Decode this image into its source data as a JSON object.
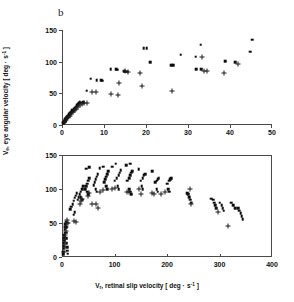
{
  "figure": {
    "panel_letter": "b",
    "background": "#ffffff",
    "marker_colors": {
      "square": "#0d0d0d",
      "plus": "#1a1a1a"
    },
    "axis_color": "#4a4a4a"
  },
  "axis_titles": {
    "y": "Ve, eye angular velocity [ deg · s-1 ]",
    "y_parts": {
      "symbol": "V",
      "symbol_sub": "e",
      "rest": ", eye angular velocity [ deg · s",
      "exp": "-1",
      "tail": " ]"
    },
    "x": "Vr, retinal slip velocity [ deg · s-1 ]",
    "x_parts": {
      "symbol": "V",
      "symbol_sub": "r",
      "rest": ", retinal slip velocity [ deg · s",
      "exp": "-1",
      "tail": " ]"
    }
  },
  "chart_data": [
    {
      "id": "top-panel",
      "type": "scatter",
      "title": "",
      "xlabel": "Vr, retinal slip velocity [ deg · s-1 ]",
      "ylabel": "Ve, eye angular velocity [ deg · s-1 ]",
      "xlim": [
        0,
        50
      ],
      "ylim": [
        0,
        150
      ],
      "xticks": [
        0,
        10,
        20,
        30,
        40,
        50
      ],
      "yticks": [
        0,
        50,
        100,
        150
      ],
      "xtick_labels": [
        "0",
        "10",
        "20",
        "30",
        "40",
        "50"
      ],
      "ytick_labels": [
        "0",
        "50",
        "100",
        "150"
      ],
      "grid": false,
      "legend": "none",
      "series": [
        {
          "name": "filled-square",
          "marker": "square",
          "points": [
            [
              0.3,
              3
            ],
            [
              0.4,
              5
            ],
            [
              0.5,
              4
            ],
            [
              0.6,
              7
            ],
            [
              0.7,
              6
            ],
            [
              0.8,
              9
            ],
            [
              0.9,
              8
            ],
            [
              1.0,
              11
            ],
            [
              1.1,
              10
            ],
            [
              1.2,
              13
            ],
            [
              1.3,
              12
            ],
            [
              1.4,
              15
            ],
            [
              1.5,
              14
            ],
            [
              1.6,
              17
            ],
            [
              1.8,
              16
            ],
            [
              1.9,
              19
            ],
            [
              2.0,
              18
            ],
            [
              2.1,
              21
            ],
            [
              2.3,
              20
            ],
            [
              2.4,
              23
            ],
            [
              2.6,
              22
            ],
            [
              2.8,
              25
            ],
            [
              3.0,
              27
            ],
            [
              3.2,
              26
            ],
            [
              3.4,
              29
            ],
            [
              3.6,
              31
            ],
            [
              3.8,
              33
            ],
            [
              4.0,
              35
            ],
            [
              4.2,
              36
            ],
            [
              4.5,
              35
            ],
            [
              5.0,
              36
            ],
            [
              5.9,
              54
            ],
            [
              6.8,
              73
            ],
            [
              8.3,
              71
            ],
            [
              9.3,
              71
            ],
            [
              9.6,
              70
            ],
            [
              11.6,
              88
            ],
            [
              12.9,
              88
            ],
            [
              13.2,
              87
            ],
            [
              14.8,
              85
            ],
            [
              15.2,
              84
            ],
            [
              15.5,
              84
            ],
            [
              19.5,
              121
            ],
            [
              20.2,
              121
            ],
            [
              21.0,
              99
            ],
            [
              26.0,
              94
            ],
            [
              26.5,
              94
            ],
            [
              28.3,
              111
            ],
            [
              31.8,
              108
            ],
            [
              32.0,
              88
            ],
            [
              33.0,
              127
            ],
            [
              33.2,
              88
            ],
            [
              38.8,
              101
            ],
            [
              41.3,
              99
            ],
            [
              44.8,
              116
            ],
            [
              45.3,
              135
            ]
          ]
        },
        {
          "name": "plus",
          "marker": "plus",
          "points": [
            [
              0.4,
              4
            ],
            [
              0.6,
              6
            ],
            [
              0.9,
              8
            ],
            [
              1.2,
              11
            ],
            [
              1.5,
              13
            ],
            [
              1.8,
              15
            ],
            [
              2.2,
              18
            ],
            [
              2.6,
              21
            ],
            [
              3.0,
              23
            ],
            [
              3.4,
              26
            ],
            [
              3.8,
              29
            ],
            [
              4.3,
              31
            ],
            [
              4.8,
              33
            ],
            [
              5.2,
              34
            ],
            [
              6.0,
              35
            ],
            [
              7.1,
              52
            ],
            [
              8.0,
              52
            ],
            [
              11.7,
              49
            ],
            [
              13.3,
              48
            ],
            [
              13.6,
              66
            ],
            [
              15.0,
              85
            ],
            [
              15.6,
              84
            ],
            [
              18.5,
              82
            ],
            [
              19.0,
              62
            ],
            [
              26.2,
              53
            ],
            [
              33.3,
              107
            ],
            [
              33.8,
              86
            ],
            [
              34.5,
              86
            ],
            [
              38.5,
              82
            ],
            [
              42.0,
              97
            ]
          ]
        }
      ]
    },
    {
      "id": "bottom-panel",
      "type": "scatter",
      "title": "",
      "xlabel": "Vr, retinal slip velocity [ deg · s-1 ]",
      "ylabel": "Ve, eye angular velocity [ deg · s-1 ]",
      "xlim": [
        0,
        400
      ],
      "ylim": [
        0,
        150
      ],
      "xticks": [
        0,
        100,
        200,
        300,
        400
      ],
      "yticks": [
        0,
        50,
        100,
        150
      ],
      "xtick_labels": [
        "0",
        "100",
        "200",
        "300",
        "400"
      ],
      "ytick_labels": [
        "0",
        "50",
        "100",
        "150"
      ],
      "grid": false,
      "legend": "none",
      "series": [
        {
          "name": "filled-square",
          "marker": "square",
          "points": [
            [
              2,
              4
            ],
            [
              2,
              8
            ],
            [
              3,
              12
            ],
            [
              3,
              16
            ],
            [
              3,
              20
            ],
            [
              4,
              24
            ],
            [
              4,
              28
            ],
            [
              4,
              32
            ],
            [
              5,
              36
            ],
            [
              5,
              40
            ],
            [
              6,
              44
            ],
            [
              6,
              48
            ],
            [
              7,
              52
            ],
            [
              8,
              44
            ],
            [
              8,
              36
            ],
            [
              9,
              28
            ],
            [
              9,
              20
            ],
            [
              10,
              14
            ],
            [
              10,
              9
            ],
            [
              11,
              5
            ],
            [
              16,
              70
            ],
            [
              18,
              74
            ],
            [
              20,
              78
            ],
            [
              22,
              83
            ],
            [
              24,
              87
            ],
            [
              26,
              90
            ],
            [
              28,
              94
            ],
            [
              22,
              62
            ],
            [
              24,
              66
            ],
            [
              30,
              84
            ],
            [
              32,
              88
            ],
            [
              34,
              92
            ],
            [
              36,
              96
            ],
            [
              38,
              100
            ],
            [
              40,
              104
            ],
            [
              36,
              88
            ],
            [
              38,
              84
            ],
            [
              44,
              100
            ],
            [
              46,
              104
            ],
            [
              48,
              108
            ],
            [
              50,
              112
            ],
            [
              52,
              116
            ],
            [
              48,
              96
            ],
            [
              50,
              92
            ],
            [
              46,
              130
            ],
            [
              52,
              132
            ],
            [
              60,
              106
            ],
            [
              62,
              110
            ],
            [
              64,
              114
            ],
            [
              66,
              118
            ],
            [
              68,
              122
            ],
            [
              64,
              100
            ],
            [
              66,
              96
            ],
            [
              72,
              131
            ],
            [
              78,
              133
            ],
            [
              80,
              110
            ],
            [
              82,
              114
            ],
            [
              84,
              118
            ],
            [
              86,
              122
            ],
            [
              88,
              126
            ],
            [
              84,
              104
            ],
            [
              86,
              100
            ],
            [
              96,
              133
            ],
            [
              102,
              137
            ],
            [
              100,
              112
            ],
            [
              104,
              116
            ],
            [
              108,
              120
            ],
            [
              110,
              124
            ],
            [
              112,
              128
            ],
            [
              106,
              104
            ],
            [
              108,
              100
            ],
            [
              122,
              135
            ],
            [
              130,
              137
            ],
            [
              124,
              112
            ],
            [
              128,
              116
            ],
            [
              130,
              120
            ],
            [
              132,
              124
            ],
            [
              134,
              126
            ],
            [
              128,
              100
            ],
            [
              130,
              96
            ],
            [
              132,
              92
            ],
            [
              146,
              129
            ],
            [
              150,
              112
            ],
            [
              154,
              116
            ],
            [
              156,
              120
            ],
            [
              158,
              122
            ],
            [
              152,
              104
            ],
            [
              154,
              100
            ],
            [
              172,
              126
            ],
            [
              178,
              110
            ],
            [
              180,
              112
            ],
            [
              182,
              114
            ],
            [
              184,
              116
            ],
            [
              180,
              100
            ],
            [
              182,
              96
            ],
            [
              200,
              108
            ],
            [
              204,
              112
            ],
            [
              206,
              114
            ],
            [
              208,
              116
            ],
            [
              202,
              100
            ],
            [
              204,
              96
            ],
            [
              238,
              94
            ],
            [
              240,
              92
            ],
            [
              242,
              88
            ],
            [
              244,
              84
            ],
            [
              246,
              80
            ],
            [
              284,
              86
            ],
            [
              288,
              84
            ],
            [
              290,
              80
            ],
            [
              292,
              76
            ],
            [
              294,
              72
            ],
            [
              300,
              80
            ],
            [
              304,
              76
            ],
            [
              306,
              72
            ],
            [
              308,
              68
            ],
            [
              322,
              80
            ],
            [
              326,
              76
            ],
            [
              330,
              72
            ],
            [
              336,
              72
            ],
            [
              338,
              68
            ],
            [
              340,
              64
            ],
            [
              342,
              60
            ],
            [
              344,
              56
            ]
          ]
        },
        {
          "name": "plus",
          "marker": "plus",
          "points": [
            [
              4,
              8
            ],
            [
              5,
              14
            ],
            [
              5,
              20
            ],
            [
              6,
              26
            ],
            [
              6,
              32
            ],
            [
              7,
              38
            ],
            [
              8,
              44
            ],
            [
              9,
              50
            ],
            [
              10,
              54
            ],
            [
              12,
              50
            ],
            [
              22,
              53
            ],
            [
              26,
              52
            ],
            [
              34,
              78
            ],
            [
              36,
              82
            ],
            [
              38,
              86
            ],
            [
              50,
              90
            ],
            [
              52,
              94
            ],
            [
              58,
              78
            ],
            [
              64,
              78
            ],
            [
              68,
              72
            ],
            [
              72,
              96
            ],
            [
              78,
              98
            ],
            [
              96,
              100
            ],
            [
              100,
              102
            ],
            [
              124,
              96
            ],
            [
              128,
              96
            ],
            [
              146,
              100
            ],
            [
              150,
              92
            ],
            [
              172,
              94
            ],
            [
              176,
              92
            ],
            [
              188,
              92
            ],
            [
              196,
              96
            ],
            [
              244,
              100
            ],
            [
              246,
              78
            ],
            [
              298,
              66
            ],
            [
              316,
              45
            ]
          ]
        }
      ]
    }
  ]
}
